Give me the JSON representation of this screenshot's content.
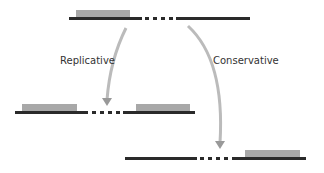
{
  "labels": {
    "replicative": "Replicative",
    "conservative": "Conservative"
  },
  "colors": {
    "strand": "#2a2a2a",
    "block": "#a8a8a8",
    "arrow": "#b8b8b8",
    "arrow_head": "#9a9a9a"
  }
}
